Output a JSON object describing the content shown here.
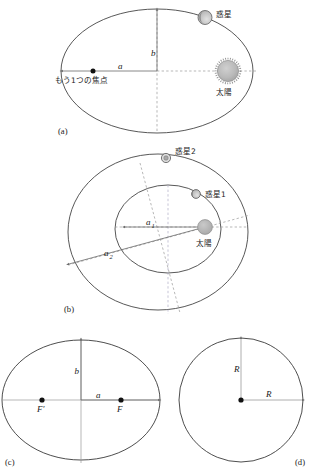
{
  "figure": {
    "title_present": false,
    "panels": [
      {
        "id": "a",
        "label": "(a)",
        "description": "Single elliptical orbit with the Sun at one focus",
        "shape": "ellipse",
        "labels": {
          "semi_major": "a",
          "semi_minor": "b",
          "other_focus": "もう1つの焦点",
          "planet": "惑星",
          "sun": "太陽"
        }
      },
      {
        "id": "b",
        "label": "(b)",
        "description": "Two nested elliptical orbits sharing the Sun as common focus",
        "shape": "two-ellipses",
        "labels": {
          "semi_major_inner": "a",
          "semi_major_inner_sub": "1",
          "semi_major_outer": "a",
          "semi_major_outer_sub": "2",
          "planet_1": "惑星1",
          "planet_2": "惑星2",
          "sun": "太陽"
        }
      },
      {
        "id": "c",
        "label": "(c)",
        "description": "Ellipse with two foci and semi-axes marked",
        "shape": "ellipse",
        "labels": {
          "semi_major": "a",
          "semi_minor": "b",
          "focus_left": "F′",
          "focus_right": "F"
        }
      },
      {
        "id": "d",
        "label": "(d)",
        "description": "Circle with radius marked vertically and horizontally",
        "shape": "circle",
        "labels": {
          "radius_vertical": "R",
          "radius_horizontal": "R"
        }
      }
    ],
    "colors": {
      "stroke": "#3a3a3a",
      "axis": "#6b6b6b",
      "dashed_axis": "#8a8a8a",
      "sun_fill": "#b5b5b5",
      "planet_fill": "#cccccc",
      "focus_dot": "#111111",
      "background": "#ffffff"
    }
  }
}
